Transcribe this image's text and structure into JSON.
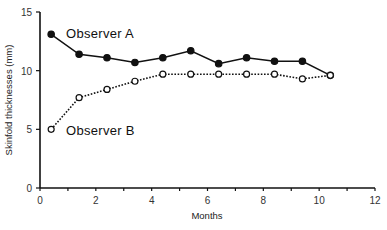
{
  "chart_data": {
    "type": "line",
    "title": "",
    "xlabel": "Months",
    "ylabel": "Skinfold thicknesses (mm)",
    "xlim": [
      0,
      12
    ],
    "ylim": [
      0,
      15
    ],
    "x_ticks": [
      0,
      2,
      4,
      6,
      8,
      10,
      12
    ],
    "y_ticks": [
      0,
      5,
      10,
      15
    ],
    "grid": false,
    "legend": "inline labels",
    "x": [
      0.4,
      1.4,
      2.4,
      3.4,
      4.4,
      5.4,
      6.4,
      7.4,
      8.4,
      9.4,
      10.4
    ],
    "series": [
      {
        "name": "Observer A",
        "marker": "filled-circle",
        "line": "solid",
        "values": [
          13.1,
          11.4,
          11.1,
          10.7,
          11.1,
          11.7,
          10.6,
          11.1,
          10.8,
          10.8,
          9.6
        ]
      },
      {
        "name": "Observer B",
        "marker": "open-circle",
        "line": "dotted",
        "values": [
          5.0,
          7.7,
          8.4,
          9.1,
          9.7,
          9.7,
          9.7,
          9.7,
          9.7,
          9.3,
          9.6
        ]
      }
    ]
  }
}
